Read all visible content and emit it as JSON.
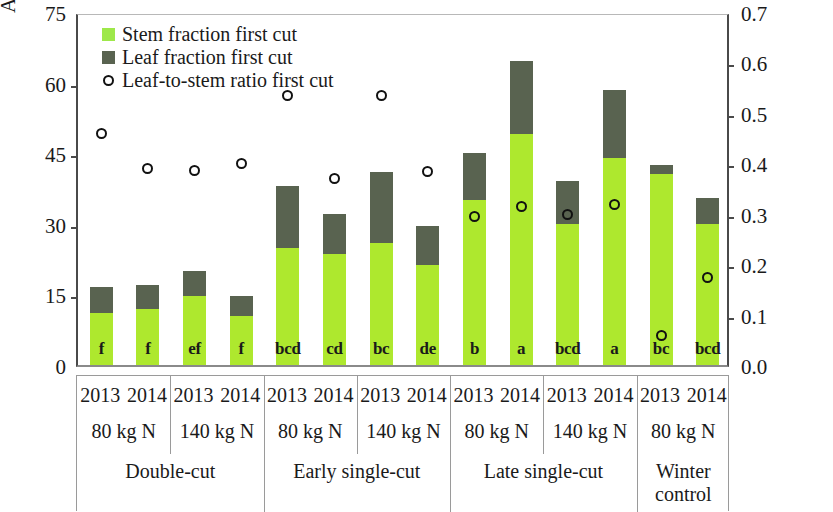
{
  "axes": {
    "left_title": "Average dry weight per shoot [g]",
    "right_title": "Leaf-to-stem ratio",
    "left_ticks": [
      "75",
      "60",
      "45",
      "30",
      "15",
      "0"
    ],
    "right_ticks": [
      "0.7",
      "0.6",
      "0.5",
      "0.4",
      "0.3",
      "0.2",
      "0.1",
      "0.0"
    ]
  },
  "legend": [
    {
      "label": "Stem fraction first cut",
      "marker": "square-swatch-stem",
      "color": "#9ee84a"
    },
    {
      "label": "Leaf fraction first cut",
      "marker": "square-swatch-leaf",
      "color": "#596350"
    },
    {
      "label": "Leaf-to-stem ratio first cut",
      "marker": "open-circle",
      "color": "#111111"
    }
  ],
  "groups": [
    {
      "treatment": "Double-cut",
      "nitrogen": [
        "80 kg N",
        "140 kg N"
      ]
    },
    {
      "treatment": "Early single-cut",
      "nitrogen": [
        "80 kg N",
        "140 kg N"
      ]
    },
    {
      "treatment": "Late single-cut",
      "nitrogen": [
        "80 kg N",
        "140 kg N"
      ]
    },
    {
      "treatment": "Winter control",
      "nitrogen": [
        "80 kg N"
      ]
    }
  ],
  "chart_data": {
    "type": "bar",
    "title": "",
    "xlabel": "",
    "ylabel": "Average dry weight per shoot [g]",
    "y2label": "Leaf-to-stem ratio",
    "ylim": [
      0,
      75
    ],
    "y2lim": [
      0,
      0.7
    ],
    "yticks": [
      0,
      15,
      30,
      45,
      60,
      75
    ],
    "y2ticks": [
      0.0,
      0.1,
      0.2,
      0.3,
      0.4,
      0.5,
      0.6,
      0.7
    ],
    "grid": false,
    "legend_position": "top-left",
    "stacked": true,
    "categories": [
      "Double-cut / 80 kg N / 2013",
      "Double-cut / 80 kg N / 2014",
      "Double-cut / 140 kg N / 2013",
      "Double-cut / 140 kg N / 2014",
      "Early single-cut / 80 kg N / 2013",
      "Early single-cut / 80 kg N / 2014",
      "Early single-cut / 140 kg N / 2013",
      "Early single-cut / 140 kg N / 2014",
      "Late single-cut / 80 kg N / 2013",
      "Late single-cut / 80 kg N / 2014",
      "Late single-cut / 140 kg N / 2013",
      "Late single-cut / 140 kg N / 2014",
      "Winter control / 80 kg N / 2013",
      "Winter control / 80 kg N / 2014"
    ],
    "years": [
      "2013",
      "2014",
      "2013",
      "2014",
      "2013",
      "2014",
      "2013",
      "2014",
      "2013",
      "2014",
      "2013",
      "2014",
      "2013",
      "2014"
    ],
    "series": [
      {
        "name": "Stem fraction first cut",
        "color": "#aee82e",
        "axis": "left",
        "values": [
          11.0,
          12.0,
          14.7,
          10.5,
          24.8,
          23.5,
          26.0,
          21.3,
          35.0,
          49.0,
          30.0,
          44.0,
          40.5,
          30.0
        ]
      },
      {
        "name": "Leaf fraction first cut",
        "color": "#596350",
        "axis": "left",
        "values": [
          5.5,
          5.0,
          5.3,
          4.2,
          13.2,
          8.5,
          15.0,
          8.2,
          10.0,
          15.5,
          9.0,
          14.5,
          2.0,
          5.5
        ]
      },
      {
        "name": "Leaf-to-stem ratio first cut",
        "color": "#111111",
        "axis": "right",
        "marker": "open-circle",
        "values": [
          0.465,
          0.395,
          0.392,
          0.405,
          0.54,
          0.375,
          0.54,
          0.39,
          0.3,
          0.32,
          0.305,
          0.325,
          0.065,
          0.18
        ]
      }
    ],
    "totals": [
      16.5,
      17.0,
      20.0,
      14.7,
      38.0,
      32.0,
      41.0,
      29.5,
      45.0,
      64.5,
      39.0,
      58.5,
      42.5,
      35.5
    ],
    "significance_letters": [
      "f",
      "f",
      "ef",
      "f",
      "bcd",
      "cd",
      "bc",
      "de",
      "b",
      "a",
      "bcd",
      "a",
      "bc",
      "bcd"
    ]
  }
}
